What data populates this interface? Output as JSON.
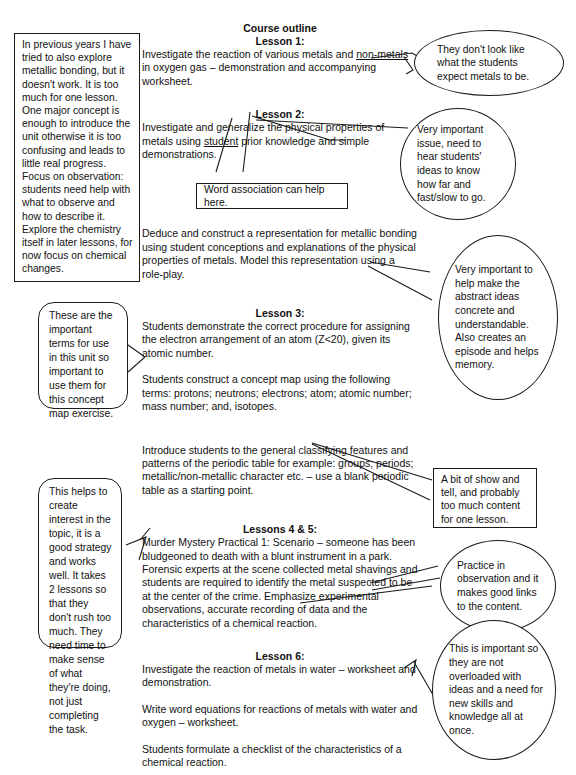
{
  "document": {
    "title": "Course outline",
    "type": "annotated course outline diagram"
  },
  "outline": {
    "heading": "Course outline",
    "lessons": [
      {
        "id": "lesson-1",
        "heading": "Lesson 1:",
        "paragraphs": [
          "Investigate the reaction of various metals and non-metals in oxygen gas – demonstration and accompanying worksheet."
        ],
        "underlined_phrase": "non-metals"
      },
      {
        "id": "lesson-2",
        "heading": "Lesson 2:",
        "paragraphs": [
          "Investigate and generalize the physical properties of metals using student prior knowledge and simple demonstrations.",
          "Deduce and construct a representation for metallic bonding using student conceptions and explanations of the physical properties of metals. Model this representation using a role-play."
        ],
        "underlined_phrase": "student"
      },
      {
        "id": "lesson-3",
        "heading": "Lesson 3:",
        "paragraphs": [
          "Students demonstrate the correct procedure for assigning the electron arrangement of an atom (Z<20), given its atomic number.",
          "Students construct a concept map using the following terms: protons; neutrons; electrons; atom; atomic number; mass number; and, isotopes.",
          "Introduce students to the general classifying features and patterns of the periodic table for example: groups; periods; metallic/non-metallic character etc. – use a blank periodic table as a starting point."
        ]
      },
      {
        "id": "lessons-4-5",
        "heading": "Lessons 4 & 5:",
        "paragraphs": [
          "Murder Mystery Practical 1: Scenario – someone has been bludgeoned to death with a blunt instrument in a park. Forensic experts at the scene collected metal shavings and students are required to identify the metal suspected to be at the center of the crime. Emphasize experimental observations, accurate recording of data and the characteristics of a chemical reaction."
        ]
      },
      {
        "id": "lesson-6",
        "heading": "Lesson 6:",
        "paragraphs": [
          "Investigate the reaction of metals in water – worksheet and demonstration.",
          "Write word equations for reactions of metals with water and oxygen – worksheet.",
          "Students formulate a checklist of the characteristics of a chemical reaction."
        ]
      }
    ]
  },
  "annotations": {
    "left": [
      {
        "id": "note-previous-years",
        "shape": "rectangle",
        "text": "In previous years I have tried to also explore metallic bonding, but it doesn't work. It is too much for one lesson. One major concept is enough to introduce the unit otherwise it is too confusing and leads to little real progress. Focus on observation: students need help with what to observe and how to describe it. Explore the chemistry itself in later lessons, for now focus on chemical changes."
      },
      {
        "id": "note-important-terms",
        "shape": "rounded",
        "text": "These are the important terms for use in this unit so important to use them for this concept map exercise."
      },
      {
        "id": "note-create-interest",
        "shape": "rounded",
        "text": "This helps to create interest in the topic, it is a good strategy and works well. It takes 2 lessons so that they don't rush too much. They need time to make sense of what they're doing, not just completing the task."
      }
    ],
    "center": [
      {
        "id": "note-word-association",
        "shape": "rectangle",
        "text": "Word association can help here."
      }
    ],
    "right": [
      {
        "id": "note-dont-look-like",
        "shape": "oval",
        "text": "They don't look like what the students expect metals to be."
      },
      {
        "id": "note-very-important-issue",
        "shape": "oval",
        "text": "Very important issue, need to hear students' ideas to know how far and fast/slow to go."
      },
      {
        "id": "note-abstract-concrete",
        "shape": "oval",
        "text": "Very important to help make the abstract ideas concrete and understandable. Also creates an episode and helps memory."
      },
      {
        "id": "note-show-and-tell",
        "shape": "rectangle",
        "text": "A bit of show and tell, and probably too much content for one lesson."
      },
      {
        "id": "note-practice-observation",
        "shape": "oval",
        "text": "Practice in observation and it makes good links to the content."
      },
      {
        "id": "note-not-overloaded",
        "shape": "oval",
        "text": "This is important so they are not overloaded with ideas and a need for new skills and knowledge all at once."
      }
    ]
  },
  "colors": {
    "ink": "#1a1a1a",
    "paper": "#ffffff"
  }
}
